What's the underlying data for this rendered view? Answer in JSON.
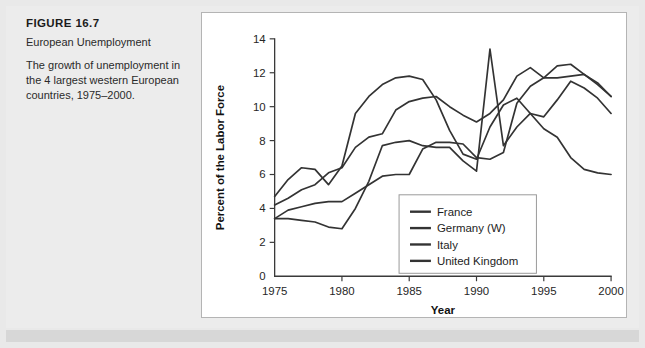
{
  "figure": {
    "label": "FIGURE 16.7",
    "title": "European Unemployment",
    "description": "The growth of unemployment in the 4 largest western European countries, 1975–2000."
  },
  "colors": {
    "page_background": "#e9e9e9",
    "panel_background": "#ffffff",
    "panel_border": "#b4b4b4",
    "axis": "#3a3a3a",
    "series_france": "#333333",
    "series_germany": "#333333",
    "series_italy": "#333333",
    "series_uk": "#333333"
  },
  "chart_data": {
    "type": "line",
    "title": "",
    "xlabel": "Year",
    "ylabel": "Percent of the Labor Force",
    "xlim": [
      1975,
      2000
    ],
    "ylim": [
      0,
      14
    ],
    "xticks": [
      1975,
      1980,
      1985,
      1990,
      1995,
      2000
    ],
    "yticks": [
      0,
      2,
      4,
      6,
      8,
      10,
      12,
      14
    ],
    "grid": false,
    "legend_position": "inside-lower-right",
    "x": [
      1975,
      1976,
      1977,
      1978,
      1979,
      1980,
      1981,
      1982,
      1983,
      1984,
      1985,
      1986,
      1987,
      1988,
      1989,
      1990,
      1991,
      1992,
      1993,
      1994,
      1995,
      1996,
      1997,
      1998,
      1999,
      2000
    ],
    "series": [
      {
        "name": "France",
        "values": [
          4.2,
          4.6,
          5.1,
          5.4,
          6.1,
          6.4,
          7.6,
          8.2,
          8.4,
          9.8,
          10.3,
          10.5,
          10.6,
          10.0,
          9.5,
          9.1,
          9.6,
          10.4,
          11.8,
          12.3,
          11.7,
          12.4,
          12.5,
          11.9,
          11.3,
          10.6
        ]
      },
      {
        "name": "Germany (W)",
        "values": [
          3.4,
          3.4,
          3.3,
          3.2,
          2.9,
          2.8,
          4.0,
          5.6,
          7.7,
          7.9,
          8.0,
          7.7,
          7.6,
          7.6,
          6.8,
          6.2,
          13.4,
          7.7,
          8.8,
          9.6,
          9.4,
          10.4,
          11.5,
          11.1,
          10.5,
          9.6
        ]
      },
      {
        "name": "Italy",
        "values": [
          3.4,
          3.9,
          4.1,
          4.3,
          4.4,
          4.4,
          4.9,
          5.4,
          5.9,
          6.0,
          6.0,
          7.5,
          7.9,
          7.9,
          7.8,
          7.0,
          6.9,
          7.3,
          10.2,
          11.2,
          11.7,
          11.7,
          11.8,
          11.9,
          11.4,
          10.6
        ]
      },
      {
        "name": "United Kingdom",
        "values": [
          4.7,
          5.7,
          6.4,
          6.3,
          5.4,
          6.5,
          9.6,
          10.6,
          11.3,
          11.7,
          11.8,
          11.6,
          10.4,
          8.6,
          7.2,
          6.9,
          8.8,
          10.1,
          10.5,
          9.6,
          8.7,
          8.2,
          7.0,
          6.3,
          6.1,
          6.0
        ]
      }
    ]
  }
}
